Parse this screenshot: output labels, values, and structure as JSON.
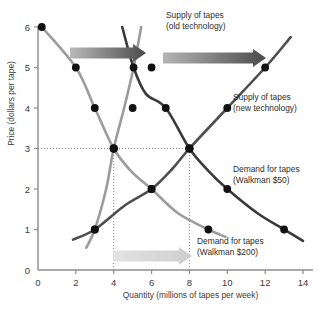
{
  "chart_data": {
    "type": "line",
    "title": "",
    "xlabel": "Quantity (millions of tapes per week)",
    "ylabel": "Price (dollars per tape)",
    "xlim": [
      0,
      14
    ],
    "ylim": [
      0,
      6
    ],
    "xticks": [
      "0",
      "2",
      "4",
      "6",
      "8",
      "10",
      "12",
      "14"
    ],
    "yticks": [
      "0",
      "1",
      "2",
      "3",
      "4",
      "5",
      "6"
    ],
    "grid": false,
    "legend_position": "inline-annotations",
    "series": [
      {
        "name": "Supply of tapes (old technology)",
        "color": "#9c9c9c",
        "role": "supply-old",
        "points": [
          [
            2.55,
            0.55
          ],
          [
            3.0,
            1.0
          ],
          [
            3.6,
            2.0
          ],
          [
            4.0,
            3.0
          ],
          [
            4.55,
            4.0
          ],
          [
            5.05,
            5.0
          ],
          [
            5.45,
            6.0
          ]
        ],
        "markers": [
          [
            3,
            1
          ],
          [
            4,
            3
          ],
          [
            5,
            4
          ],
          [
            6,
            5
          ]
        ]
      },
      {
        "name": "Supply of tapes (new technology)",
        "color": "#4e4e4e",
        "role": "supply-new",
        "points": [
          [
            1.85,
            0.75
          ],
          [
            3.0,
            1.0
          ],
          [
            4.6,
            1.6
          ],
          [
            6.0,
            2.0
          ],
          [
            7.1,
            2.5
          ],
          [
            8.0,
            3.0
          ],
          [
            10.0,
            4.0
          ],
          [
            12.0,
            5.0
          ],
          [
            13.35,
            5.75
          ]
        ],
        "markers": [
          [
            3,
            1
          ],
          [
            6,
            2
          ],
          [
            8,
            3
          ],
          [
            10,
            4
          ],
          [
            12,
            5
          ]
        ]
      },
      {
        "name": "Demand for tapes (Walkman $200)",
        "color": "#9c9c9c",
        "role": "demand-old",
        "points": [
          [
            0.2,
            6.0
          ],
          [
            2.0,
            5.0
          ],
          [
            3.0,
            4.0
          ],
          [
            4.0,
            3.0
          ],
          [
            4.9,
            2.45
          ],
          [
            6.0,
            2.0
          ],
          [
            7.4,
            1.4
          ],
          [
            9.0,
            1.0
          ],
          [
            9.9,
            0.82
          ]
        ],
        "markers": [
          [
            0.2,
            6
          ],
          [
            2,
            5
          ],
          [
            3,
            4
          ],
          [
            4,
            3
          ],
          [
            6,
            2
          ],
          [
            9,
            1
          ]
        ]
      },
      {
        "name": "Demand for tapes (Walkman $50)",
        "color": "#3a3a3a",
        "role": "demand-new",
        "points": [
          [
            4.45,
            6.0
          ],
          [
            5.05,
            5.0
          ],
          [
            5.7,
            4.35
          ],
          [
            6.75,
            4.0
          ],
          [
            8.0,
            3.0
          ],
          [
            9.0,
            2.45
          ],
          [
            10.0,
            2.0
          ],
          [
            11.6,
            1.4
          ],
          [
            13.0,
            1.0
          ],
          [
            14.0,
            0.72
          ]
        ],
        "markers": [
          [
            5.05,
            5
          ],
          [
            6.75,
            4
          ],
          [
            8,
            3
          ],
          [
            10,
            2
          ],
          [
            13,
            1
          ]
        ]
      }
    ],
    "equilibria": [
      {
        "label": "old equilibrium",
        "quantity": 4,
        "price": 3
      },
      {
        "label": "new equilibrium",
        "quantity": 8,
        "price": 3
      }
    ],
    "guides": [
      {
        "type": "horizontal",
        "value": 3,
        "from": 0,
        "to": 8
      },
      {
        "type": "vertical",
        "value": 4,
        "from": 0,
        "to": 3
      },
      {
        "type": "vertical",
        "value": 8,
        "from": 0,
        "to": 3
      }
    ],
    "arrows": [
      {
        "name": "supply-shift-arrow-left",
        "x1": 70,
        "y1": 53,
        "x2": 146,
        "y2": 53,
        "color_start": "#b9b9b9",
        "color_end": "#4a4a4a"
      },
      {
        "name": "supply-shift-arrow-right",
        "x1": 163,
        "y1": 58,
        "x2": 266,
        "y2": 58,
        "color_start": "#b5b5b5",
        "color_end": "#4a4a4a"
      },
      {
        "name": "demand-shift-arrow",
        "x1": 113,
        "y1": 256,
        "x2": 192,
        "y2": 256,
        "color_start": "#e2e2e2",
        "color_end": "#cfcfcf"
      }
    ],
    "annotations": [
      {
        "name": "supply-old-label",
        "lines": [
          "Supply of tapes",
          "(old technology)"
        ],
        "x": 166,
        "y": 18
      },
      {
        "name": "supply-new-label",
        "lines": [
          "Supply of tapes",
          "(new technology)"
        ],
        "x": 233,
        "y": 100
      },
      {
        "name": "demand-new-label",
        "lines": [
          "Demand for tapes",
          "(Walkman $50)"
        ],
        "x": 233,
        "y": 172
      },
      {
        "name": "demand-old-label",
        "lines": [
          "Demand for tapes",
          "(Walkman $200)"
        ],
        "x": 197,
        "y": 244
      }
    ]
  }
}
